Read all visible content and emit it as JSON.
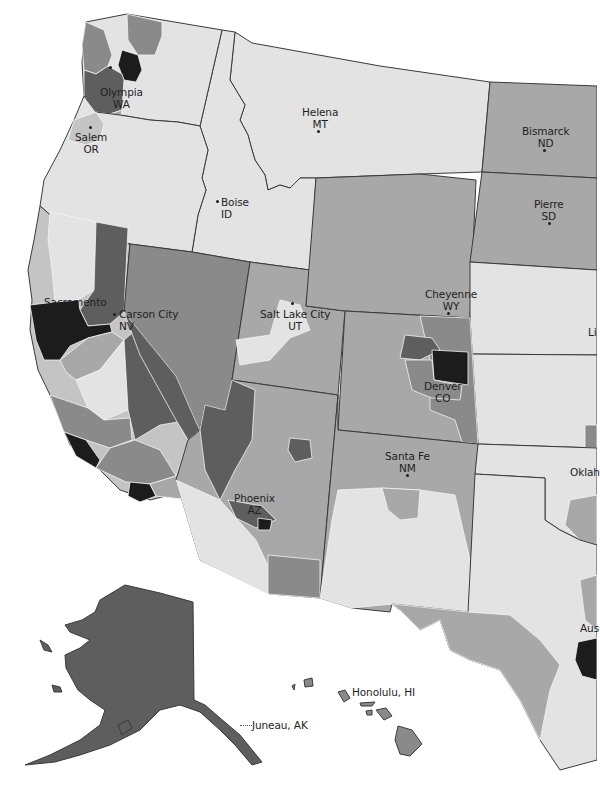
{
  "map": {
    "type": "choropleth",
    "region": "Western United States (with Alaska and Hawaii insets)",
    "colors": {
      "level_1": "#e3e3e3",
      "level_2": "#c4c4c4",
      "level_3": "#a8a8a8",
      "level_4": "#8a8a8a",
      "level_5": "#5e5e5e",
      "level_6": "#1c1c1c",
      "border": "#3a3a3a",
      "background": "#ffffff"
    },
    "capitals": [
      {
        "city": "Olympia",
        "state": "WA"
      },
      {
        "city": "Salem",
        "state": "OR"
      },
      {
        "city": "Helena",
        "state": "MT"
      },
      {
        "city": "Bismarck",
        "state": "ND"
      },
      {
        "city": "Pierre",
        "state": "SD"
      },
      {
        "city": "Boise",
        "state": "ID"
      },
      {
        "city": "Sacramento",
        "state": "CA"
      },
      {
        "city": "Carson City",
        "state": "NV"
      },
      {
        "city": "Salt Lake City",
        "state": "UT"
      },
      {
        "city": "Cheyenne",
        "state": "WY"
      },
      {
        "city": "Denver",
        "state": "CO"
      },
      {
        "city": "Santa Fe",
        "state": "NM"
      },
      {
        "city": "Phoenix",
        "state": "AZ"
      }
    ],
    "inset_labels": {
      "alaska": "Juneau, AK",
      "hawaii": "Honolulu, HI"
    },
    "clipped_labels": {
      "lincoln": "Li",
      "oklahoma_city": "Oklah",
      "austin": "Aus"
    }
  }
}
